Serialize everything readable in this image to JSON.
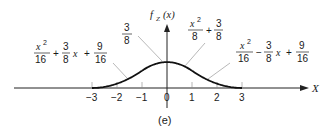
{
  "chart_data": {
    "type": "line",
    "title": "",
    "caption": "(e)",
    "ylabel": "f_Z(x)",
    "ylabel_main": "f",
    "ylabel_sub": "Z",
    "ylabel_arg": "(x)",
    "xlabel": "X",
    "xlim": [
      -4,
      4
    ],
    "ylim": [
      0,
      0.5
    ],
    "x_ticks": [
      -3,
      -2,
      -1,
      0,
      1,
      2,
      3
    ],
    "x_tick_labels": [
      "−3",
      "−2",
      "−1",
      "0",
      "1",
      "2",
      "3"
    ],
    "grid": false,
    "series": [
      {
        "name": "left piece",
        "domain": [
          -3,
          -1
        ],
        "formula": "x^2/16 + 3x/8 + 9/16",
        "x": [
          -3,
          -2.5,
          -2,
          -1.5,
          -1
        ],
        "y": [
          0,
          0.015625,
          0.0625,
          0.140625,
          0.25
        ]
      },
      {
        "name": "middle piece",
        "domain": [
          -1,
          1
        ],
        "formula": "-x^2/8 + 3/8",
        "x": [
          -1,
          -0.5,
          0,
          0.5,
          1
        ],
        "y": [
          0.25,
          0.34375,
          0.375,
          0.34375,
          0.25
        ]
      },
      {
        "name": "right piece",
        "domain": [
          1,
          3
        ],
        "formula": "x^2/16 - 3x/8 + 9/16",
        "x": [
          1,
          1.5,
          2,
          2.5,
          3
        ],
        "y": [
          0.25,
          0.140625,
          0.0625,
          0.015625,
          0
        ]
      }
    ],
    "annotations": {
      "left": {
        "t1_num": "x",
        "t1_exp": "2",
        "t1_den": "16",
        "op1": "+",
        "t2_num": "3",
        "t2_den": "8",
        "t2_var": "x",
        "op2": "+",
        "t3_num": "9",
        "t3_den": "16"
      },
      "peak": {
        "num": "3",
        "den": "8"
      },
      "middle": {
        "t1_num": "x",
        "t1_exp": "2",
        "t1_den": "8",
        "op1": "+",
        "t2_num": "3",
        "t2_den": "8"
      },
      "right": {
        "t1_num": "x",
        "t1_exp": "2",
        "t1_den": "16",
        "op1": "−",
        "t2_num": "3",
        "t2_den": "8",
        "t2_var": "x",
        "op2": "+",
        "t3_num": "9",
        "t3_den": "16"
      }
    }
  }
}
